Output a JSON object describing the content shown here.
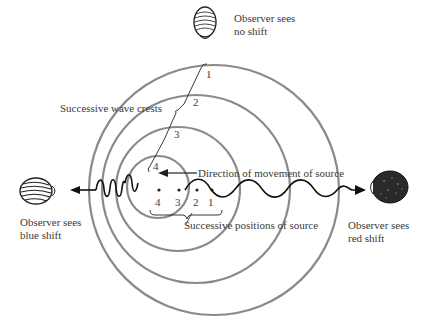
{
  "labels": {
    "observer_top": [
      "Observer sees",
      "no shift"
    ],
    "observer_left": [
      "Observer sees",
      "blue shift"
    ],
    "observer_right": [
      "Observer sees",
      "red shift"
    ],
    "wave_crests": "Successive wave crests",
    "direction": "Direction of movement of source",
    "positions": "Successive positions of source"
  },
  "crest_numbers": [
    "1",
    "2",
    "3",
    "4"
  ],
  "position_numbers": [
    "4",
    "3",
    "2",
    "1"
  ],
  "colors": {
    "circle": "#8a8a8a",
    "line": "#222222",
    "text": "#3a3a3a"
  }
}
